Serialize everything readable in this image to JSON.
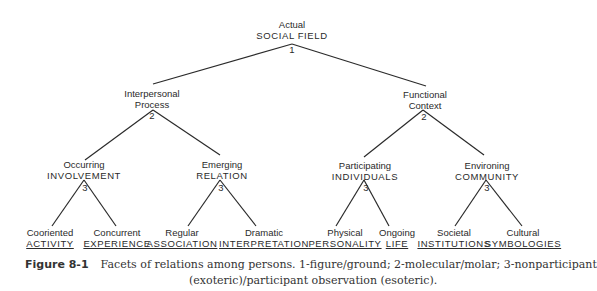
{
  "diagram": {
    "root": {
      "top": "Actual",
      "main": "SOCIAL FIELD",
      "num": "1"
    },
    "level2": [
      {
        "top": "Interpersonal",
        "main": "Process",
        "num": "2"
      },
      {
        "top": "Functional",
        "main": "Context",
        "num": "2"
      }
    ],
    "level3": [
      {
        "top": "Occurring",
        "main": "INVOLVEMENT",
        "num": "3"
      },
      {
        "top": "Emerging",
        "main": "RELATION",
        "num": "3"
      },
      {
        "top": "Participating",
        "main": "INDIVIDUALS",
        "num": "3"
      },
      {
        "top": "Environing",
        "main": "COMMUNITY",
        "num": "3"
      }
    ],
    "leaves": [
      {
        "top": "Cooriented",
        "main": "ACTIVITY"
      },
      {
        "top": "Concurrent",
        "main": "EXPERIENCE"
      },
      {
        "top": "Regular",
        "main": "ASSOCIATION"
      },
      {
        "top": "Dramatic",
        "main": "INTERPRETATION"
      },
      {
        "top": "Physical",
        "main": "PERSONALITY"
      },
      {
        "top": "Ongoing",
        "main": "LIFE"
      },
      {
        "top": "Societal",
        "main": "INSTITUTIONS"
      },
      {
        "top": "Cultural",
        "main": "SYMBOLOGIES"
      }
    ]
  },
  "caption": {
    "label": "Figure 8-1",
    "line1": "Facets of relations among persons. 1-figure/ground; 2-molecular/molar; 3-nonparticipant",
    "line2": "(exoteric)/participant observation (esoteric)."
  }
}
